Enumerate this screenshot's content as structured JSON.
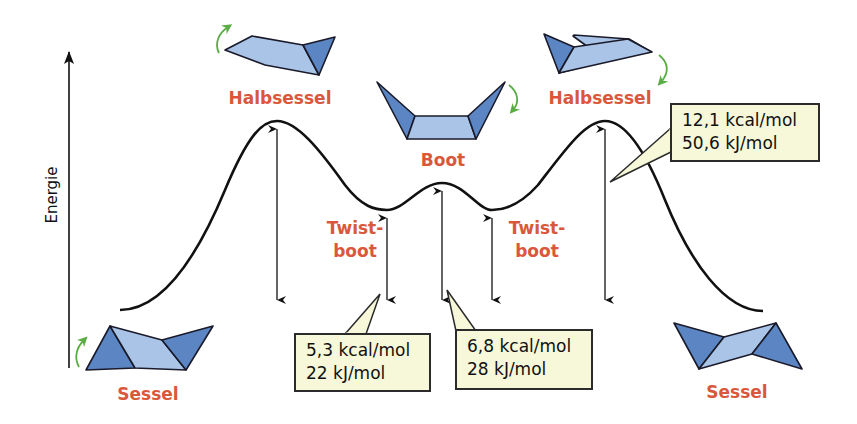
{
  "axis": {
    "label": "Energie",
    "direction": "up"
  },
  "conformations": {
    "sessel_left": {
      "label": "Sessel"
    },
    "halbsessel_left": {
      "label": "Halbsessel"
    },
    "twistboot_left": {
      "line1": "Twist-",
      "line2": "boot"
    },
    "boot": {
      "label": "Boot"
    },
    "twistboot_right": {
      "line1": "Twist-",
      "line2": "boot"
    },
    "halbsessel_right": {
      "label": "Halbsessel"
    },
    "sessel_right": {
      "label": "Sessel"
    }
  },
  "energy_boxes": {
    "halbsessel": {
      "kcal": "12,1 kcal/mol",
      "kj": "50,6 kJ/mol"
    },
    "twistboot": {
      "kcal": "5,3 kcal/mol",
      "kj": "22 kJ/mol"
    },
    "boot": {
      "kcal": "6,8 kcal/mol",
      "kj": "28 kJ/mol"
    }
  },
  "colors": {
    "label_red": "#d9583b",
    "ring_dark": "#5b86c3",
    "ring_light": "#a9c4e6",
    "rotation_arrow_green": "#5aac44",
    "box_fill": "#f7f7d9",
    "line": "#111111"
  }
}
